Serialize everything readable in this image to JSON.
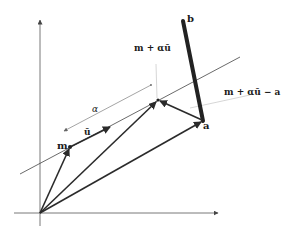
{
  "diagram": {
    "labels": {
      "b": "b",
      "a": "a",
      "m": "m",
      "u": "ū",
      "alpha": "α",
      "m_plus_alpha_u": "m + αū",
      "m_plus_alpha_u_minus_a": "m + αū − a"
    },
    "points": {
      "origin": [
        40,
        213
      ],
      "m": [
        70,
        147
      ],
      "u_tip": [
        108,
        128
      ],
      "proj": [
        158,
        100
      ],
      "a": [
        203,
        121
      ],
      "b": [
        183,
        21
      ]
    },
    "colors": {
      "ink": "#2b2b2b",
      "thin_line": "#555555",
      "leader": "#bbbbbb"
    }
  }
}
